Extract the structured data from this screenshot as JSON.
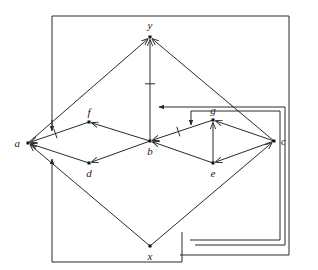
{
  "diagram": {
    "type": "directed graph (Hasse-style diagram with feedback wiring)",
    "nodes": [
      {
        "id": "y",
        "label": "y"
      },
      {
        "id": "a",
        "label": "a"
      },
      {
        "id": "f",
        "label": "f"
      },
      {
        "id": "b",
        "label": "b"
      },
      {
        "id": "d",
        "label": "d"
      },
      {
        "id": "g",
        "label": "g"
      },
      {
        "id": "e",
        "label": "e"
      },
      {
        "id": "c",
        "label": "c"
      },
      {
        "id": "x",
        "label": "x"
      }
    ],
    "edges": [
      {
        "from": "a",
        "to": "y",
        "marked": false
      },
      {
        "from": "b",
        "to": "y",
        "marked": true
      },
      {
        "from": "c",
        "to": "y",
        "marked": false
      },
      {
        "from": "f",
        "to": "a",
        "marked": true
      },
      {
        "from": "d",
        "to": "a",
        "marked": false
      },
      {
        "from": "x",
        "to": "a",
        "marked": false
      },
      {
        "from": "b",
        "to": "f",
        "marked": false
      },
      {
        "from": "b",
        "to": "d",
        "marked": false
      },
      {
        "from": "g",
        "to": "b",
        "marked": true
      },
      {
        "from": "e",
        "to": "b",
        "marked": false
      },
      {
        "from": "c",
        "to": "g",
        "marked": false
      },
      {
        "from": "e",
        "to": "g",
        "marked": false
      },
      {
        "from": "c",
        "to": "e",
        "marked": false
      },
      {
        "from": "x",
        "to": "c",
        "marked": false
      }
    ],
    "wires": [
      {
        "description": "outer loop from left of a up, across top, down right side, back along bottom",
        "target": "edge a-y"
      },
      {
        "description": "bottom loop from x-region to left, arrow into edge x-a",
        "target": "edge x-a"
      },
      {
        "description": "nested loop arrow into edge b-y",
        "target": "edge b-y"
      },
      {
        "description": "nested loop arrow into edge g-b",
        "target": "edge g-b"
      }
    ]
  }
}
